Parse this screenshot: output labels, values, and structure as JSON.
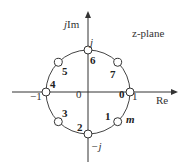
{
  "diagram": {
    "plane_label": "z-plane",
    "axis_x_label": "Re",
    "axis_y_label": "jIm",
    "axis_y_prefix": "j",
    "axis_y_suffix": "Im",
    "tick_labels": {
      "pos_real": "1",
      "neg_real": "−1",
      "pos_imag": "j",
      "neg_imag": "−j",
      "origin": "0"
    },
    "index_label": "m",
    "unit_circle_points": [
      {
        "index": "0",
        "angle_deg": 0
      },
      {
        "index": "1",
        "angle_deg": -45
      },
      {
        "index": "2",
        "angle_deg": -90
      },
      {
        "index": "3",
        "angle_deg": -135
      },
      {
        "index": "4",
        "angle_deg": 180
      },
      {
        "index": "5",
        "angle_deg": 135
      },
      {
        "index": "6",
        "angle_deg": 90
      },
      {
        "index": "7",
        "angle_deg": 45
      }
    ]
  }
}
